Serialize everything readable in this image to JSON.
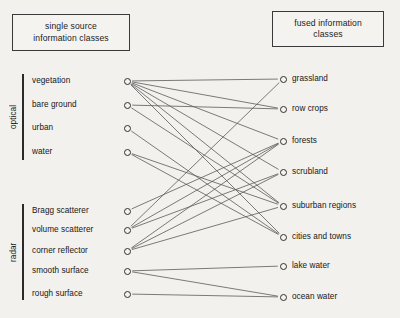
{
  "headers": {
    "left": "single source\ninformation classes",
    "right": "fused information\nclasses"
  },
  "groups": [
    {
      "name": "optical",
      "bar": {
        "x": 22,
        "y": 74,
        "height": 86
      }
    },
    {
      "name": "radar",
      "bar": {
        "x": 22,
        "y": 204,
        "height": 96
      }
    }
  ],
  "source_nodes": [
    {
      "id": "vegetation",
      "label": "vegetation",
      "x": 127,
      "y": 81,
      "label_x": 32,
      "group": "optical"
    },
    {
      "id": "bare_ground",
      "label": "bare ground",
      "x": 127,
      "y": 105,
      "label_x": 32,
      "group": "optical"
    },
    {
      "id": "urban",
      "label": "urban",
      "x": 127,
      "y": 128,
      "label_x": 32,
      "group": "optical"
    },
    {
      "id": "water",
      "label": "water",
      "x": 127,
      "y": 152,
      "label_x": 32,
      "group": "optical"
    },
    {
      "id": "bragg_scatterer",
      "label": "Bragg scatterer",
      "x": 127,
      "y": 211,
      "label_x": 32,
      "group": "radar"
    },
    {
      "id": "volume_scatterer",
      "label": "volume scatterer",
      "x": 127,
      "y": 230,
      "label_x": 32,
      "group": "radar"
    },
    {
      "id": "corner_reflector",
      "label": "corner reflector",
      "x": 127,
      "y": 251,
      "label_x": 32,
      "group": "radar"
    },
    {
      "id": "smooth_surface",
      "label": "smooth surface",
      "x": 127,
      "y": 271,
      "label_x": 32,
      "group": "radar"
    },
    {
      "id": "rough_surface",
      "label": "rough surface",
      "x": 127,
      "y": 294,
      "label_x": 32,
      "group": "radar"
    }
  ],
  "fused_nodes": [
    {
      "id": "grassland",
      "label": "grassland",
      "x": 283,
      "y": 79
    },
    {
      "id": "row_crops",
      "label": "row crops",
      "x": 283,
      "y": 109
    },
    {
      "id": "forests",
      "label": "forests",
      "x": 283,
      "y": 141
    },
    {
      "id": "scrubland",
      "label": "scrubland",
      "x": 283,
      "y": 172
    },
    {
      "id": "suburban_regions",
      "label": "suburban regions",
      "x": 283,
      "y": 206
    },
    {
      "id": "cities_and_towns",
      "label": "cities and towns",
      "x": 283,
      "y": 237
    },
    {
      "id": "lake_water",
      "label": "lake water",
      "x": 283,
      "y": 266
    },
    {
      "id": "ocean_water",
      "label": "ocean water",
      "x": 283,
      "y": 297
    }
  ],
  "links": [
    {
      "from": "vegetation",
      "to": "grassland"
    },
    {
      "from": "vegetation",
      "to": "row_crops"
    },
    {
      "from": "vegetation",
      "to": "forests"
    },
    {
      "from": "vegetation",
      "to": "scrubland"
    },
    {
      "from": "vegetation",
      "to": "suburban_regions"
    },
    {
      "from": "vegetation",
      "to": "cities_and_towns"
    },
    {
      "from": "bare_ground",
      "to": "row_crops"
    },
    {
      "from": "bare_ground",
      "to": "suburban_regions"
    },
    {
      "from": "urban",
      "to": "cities_and_towns"
    },
    {
      "from": "water",
      "to": "suburban_regions"
    },
    {
      "from": "water",
      "to": "cities_and_towns"
    },
    {
      "from": "bragg_scatterer",
      "to": "forests"
    },
    {
      "from": "volume_scatterer",
      "to": "grassland"
    },
    {
      "from": "volume_scatterer",
      "to": "forests"
    },
    {
      "from": "volume_scatterer",
      "to": "scrubland"
    },
    {
      "from": "corner_reflector",
      "to": "forests"
    },
    {
      "from": "corner_reflector",
      "to": "scrubland"
    },
    {
      "from": "corner_reflector",
      "to": "suburban_regions"
    },
    {
      "from": "smooth_surface",
      "to": "lake_water"
    },
    {
      "from": "smooth_surface",
      "to": "ocean_water"
    },
    {
      "from": "rough_surface",
      "to": "ocean_water"
    }
  ],
  "style": {
    "line_color": "#5a5a5a",
    "node_stroke": "#2f2f2f",
    "text_color": "#161616",
    "background": "#f2f1ee"
  }
}
